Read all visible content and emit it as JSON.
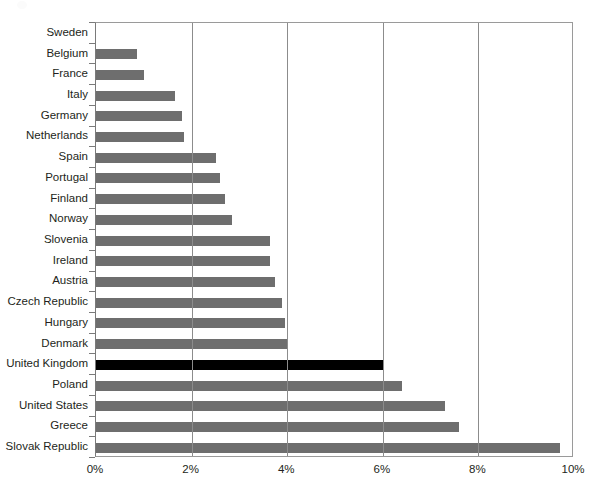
{
  "chart_data": {
    "type": "bar",
    "orientation": "horizontal",
    "title": "",
    "subtitle": "",
    "xlabel": "",
    "ylabel": "",
    "xlim": [
      0,
      10
    ],
    "xtick_labels": [
      "0%",
      "2%",
      "4%",
      "6%",
      "8%",
      "10%"
    ],
    "xtick_values": [
      0,
      2,
      4,
      6,
      8,
      10
    ],
    "grid": "vertical",
    "legend": "none",
    "value_unit": "%",
    "categories": [
      "Sweden",
      "Belgium",
      "France",
      "Italy",
      "Germany",
      "Netherlands",
      "Spain",
      "Portugal",
      "Finland",
      "Norway",
      "Slovenia",
      "Ireland",
      "Austria",
      "Czech Republic",
      "Hungary",
      "Denmark",
      "United Kingdom",
      "Poland",
      "United States",
      "Greece",
      "Slovak Republic"
    ],
    "values": [
      0.0,
      0.85,
      1.0,
      1.65,
      1.8,
      1.85,
      2.5,
      2.6,
      2.7,
      2.85,
      3.65,
      3.65,
      3.75,
      3.9,
      3.95,
      4.0,
      6.0,
      6.4,
      7.3,
      7.6,
      9.7
    ],
    "highlight_category": "United Kingdom",
    "colors": {
      "bar": "#6e6e6e",
      "highlight_bar": "#000000",
      "gridline": "#8c8c8c",
      "axis": "#7a7a7a",
      "text": "#231f20",
      "background": "#ffffff"
    }
  }
}
